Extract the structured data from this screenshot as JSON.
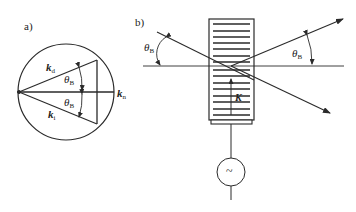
{
  "panels": {
    "a": {
      "label": "a)",
      "vectors": {
        "kd": {
          "symbol": "k",
          "sub": "d"
        },
        "ki": {
          "symbol": "k",
          "sub": "i"
        },
        "kn": {
          "symbol": "k",
          "sub": "n"
        }
      },
      "angles": [
        {
          "symbol": "θ",
          "sub": "B"
        },
        {
          "symbol": "θ",
          "sub": "B"
        }
      ]
    },
    "b": {
      "label": "b)",
      "angles": [
        {
          "symbol": "θ",
          "sub": "B"
        },
        {
          "symbol": "θ",
          "sub": "B"
        }
      ],
      "wave_vector": {
        "symbol": "K"
      },
      "source_symbol": "~"
    }
  },
  "colors": {
    "line": "#2a2a2a",
    "background": "#ffffff"
  }
}
